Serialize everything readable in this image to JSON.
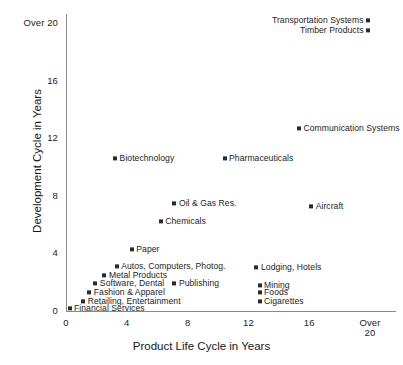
{
  "chart_data": {
    "type": "scatter",
    "title": "",
    "xlabel": "Product Life Cycle in Years",
    "ylabel": "Development Cycle in Years",
    "xlim": [
      0,
      20
    ],
    "ylim": [
      0,
      20
    ],
    "grid": false,
    "legend": "none",
    "marker_color": "#2b2b2b",
    "axis_color": "#8a8a8a",
    "xticks": [
      {
        "value": 0,
        "label": "0"
      },
      {
        "value": 4,
        "label": "4"
      },
      {
        "value": 8,
        "label": "8"
      },
      {
        "value": 12,
        "label": "12"
      },
      {
        "value": 16,
        "label": "16"
      },
      {
        "value": 20,
        "label": "Over\n20"
      }
    ],
    "yticks": [
      {
        "value": 0,
        "label": "0"
      },
      {
        "value": 4,
        "label": "4"
      },
      {
        "value": 8,
        "label": "8"
      },
      {
        "value": 12,
        "label": "12"
      },
      {
        "value": 16,
        "label": "16"
      },
      {
        "value": 20,
        "label": "Over 20"
      }
    ],
    "points": [
      {
        "label": "Transportation Systems",
        "x": 20.0,
        "y": 20.1,
        "side": "left"
      },
      {
        "label": "Timber Products",
        "x": 20.0,
        "y": 19.4,
        "side": "left"
      },
      {
        "label": "Communication Systems",
        "x": 15.2,
        "y": 12.6,
        "side": "right"
      },
      {
        "label": "Biotechnology",
        "x": 3.1,
        "y": 10.5,
        "side": "right"
      },
      {
        "label": "Pharmaceuticals",
        "x": 10.3,
        "y": 10.5,
        "side": "right"
      },
      {
        "label": "Oil & Gas Res.",
        "x": 7.0,
        "y": 7.4,
        "side": "right"
      },
      {
        "label": "Aircraft",
        "x": 16.0,
        "y": 7.2,
        "side": "right"
      },
      {
        "label": "Chemicals",
        "x": 6.1,
        "y": 6.1,
        "side": "right"
      },
      {
        "label": "Paper",
        "x": 4.2,
        "y": 4.2,
        "side": "right"
      },
      {
        "label": "Autos, Computers, Photog.",
        "x": 3.2,
        "y": 3.0,
        "side": "right"
      },
      {
        "label": "Metal Products",
        "x": 2.4,
        "y": 2.4,
        "side": "right"
      },
      {
        "label": "Software, Dental",
        "x": 1.8,
        "y": 1.8,
        "side": "right"
      },
      {
        "label": "Publishing",
        "x": 7.0,
        "y": 1.8,
        "side": "right"
      },
      {
        "label": "Fashion & Apparel",
        "x": 1.4,
        "y": 1.2,
        "side": "right"
      },
      {
        "label": "Retailing, Entertainment",
        "x": 1.0,
        "y": 0.6,
        "side": "right"
      },
      {
        "label": "Financial Services",
        "x": 0.1,
        "y": 0.1,
        "side": "right"
      },
      {
        "label": "Lodging, Hotels",
        "x": 12.4,
        "y": 2.9,
        "side": "right"
      },
      {
        "label": "Mining",
        "x": 12.6,
        "y": 1.7,
        "side": "right"
      },
      {
        "label": "Foods",
        "x": 12.6,
        "y": 1.2,
        "side": "right"
      },
      {
        "label": "Cigarettes",
        "x": 12.6,
        "y": 0.6,
        "side": "right"
      }
    ]
  }
}
